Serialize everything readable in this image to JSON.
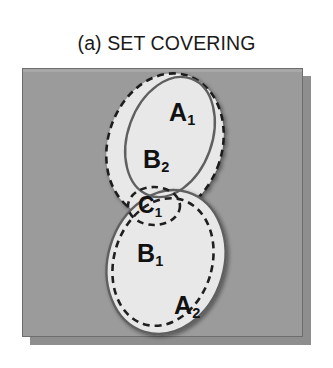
{
  "figure": {
    "caption": "(a) SET COVERING\nEXAMPLE",
    "caption_line1": "(a) SET COVERING",
    "caption_line2": "EXAMPLE"
  },
  "colors": {
    "panel_background": "#9b9b9b",
    "panel_border": "#6d6d6d",
    "panel_shadow": "#8e8e8e",
    "set_fill": "#e8e8e8",
    "set_stroke": "#1f1f1f",
    "set_stroke_soft": "#6a6a6a",
    "label_color": "#111111",
    "page_background": "#ffffff"
  },
  "diagram": {
    "type": "venn-set-cover",
    "universe": {
      "name": "universe-panel",
      "shape": "rectangle",
      "x": 22,
      "y": 68,
      "width": 281,
      "height": 269,
      "fill": "#9b9b9b"
    },
    "groups": [
      {
        "name": "upper-group",
        "outer": {
          "label": "B",
          "subscript": "2",
          "label_text": "B2",
          "outline": "dashed",
          "shape": "ellipse",
          "cx": 165,
          "cy": 145,
          "rx": 57,
          "ry": 73,
          "rotate": 18,
          "label_x": 156,
          "label_y": 159
        },
        "inner": {
          "label": "A",
          "subscript": "1",
          "label_text": "A1",
          "outline": "solid",
          "shape": "ellipse",
          "cx": 170,
          "cy": 137,
          "rx": 42,
          "ry": 62,
          "rotate": 20,
          "label_x": 182,
          "label_y": 112
        }
      },
      {
        "name": "lower-group",
        "outer": {
          "label": "A",
          "subscript": "2",
          "label_text": "A2",
          "outline": "solid",
          "shape": "ellipse",
          "cx": 166,
          "cy": 262,
          "rx": 58,
          "ry": 73,
          "rotate": 17,
          "label_x": 187,
          "label_y": 305
        },
        "inner": {
          "label": "B",
          "subscript": "1",
          "label_text": "B1",
          "outline": "dashed",
          "shape": "ellipse",
          "cx": 163,
          "cy": 262,
          "rx": 49,
          "ry": 65,
          "rotate": 17,
          "label_x": 150,
          "label_y": 253
        },
        "marker": {
          "label": "C",
          "subscript": "1",
          "label_text": "C1",
          "outline": "dashed",
          "shape": "ellipse",
          "cx": 154,
          "cy": 206,
          "rx": 26,
          "ry": 19,
          "rotate": 0,
          "label_x": 150,
          "label_y": 205
        }
      }
    ],
    "sets": [
      {
        "id": "A1",
        "label": "A",
        "subscript": "1",
        "outline": "solid",
        "group": "upper"
      },
      {
        "id": "B2",
        "label": "B",
        "subscript": "2",
        "outline": "dashed",
        "group": "upper"
      },
      {
        "id": "C1",
        "label": "C",
        "subscript": "1",
        "outline": "dashed",
        "group": "lower"
      },
      {
        "id": "B1",
        "label": "B",
        "subscript": "1",
        "outline": "dashed",
        "group": "lower"
      },
      {
        "id": "A2",
        "label": "A",
        "subscript": "2",
        "outline": "solid",
        "group": "lower"
      }
    ]
  }
}
